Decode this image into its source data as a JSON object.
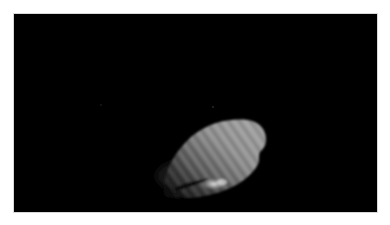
{
  "image": {
    "description": "Grayscale image of an elongated, striated bright body against a black background",
    "background_color": "#000000",
    "frame_color": "#ffffff",
    "object": {
      "name": "illuminated-body",
      "shape": "elongated ellipsoid tilted upward to the right",
      "surface": "diagonal striations",
      "highlight": "bright specular patch near bottom edge",
      "shadow": "dark curved notch at lower-left edge",
      "base_tone": "#8a8a8a",
      "bright_tone": "#d8d8d8",
      "dark_tone": "#2a2a2a"
    },
    "faint_points": [
      {
        "x": 101,
        "y": 105
      },
      {
        "x": 213,
        "y": 107
      }
    ]
  }
}
